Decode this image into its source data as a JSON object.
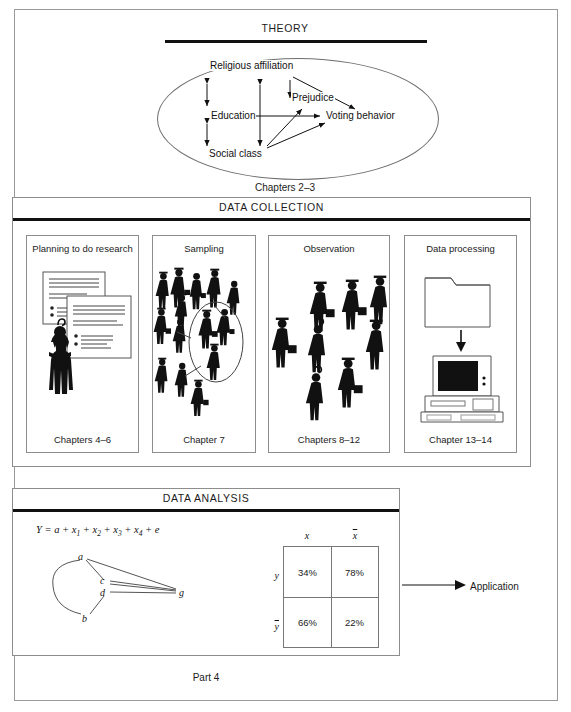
{
  "figure": {
    "outer_frame": true,
    "bottom_caption": "Part 4"
  },
  "theory": {
    "title": "THEORY",
    "caption": "Chapters 2–3",
    "nodes": [
      {
        "id": "religious-affiliation",
        "label": "Religious affiliation"
      },
      {
        "id": "education",
        "label": "Education"
      },
      {
        "id": "social-class",
        "label": "Social class"
      },
      {
        "id": "prejudice",
        "label": "Prejudice"
      },
      {
        "id": "voting-behavior",
        "label": "Voting behavior"
      }
    ],
    "relations": [
      {
        "from": "Religious affiliation",
        "to": "Education",
        "type": "double-arrow"
      },
      {
        "from": "Education",
        "to": "Social class",
        "type": "double-arrow"
      },
      {
        "from": "Religious affiliation",
        "to": "Social class",
        "type": "double-arrow"
      },
      {
        "from": "Religious affiliation",
        "to": "Prejudice",
        "type": "arrow"
      },
      {
        "from": "Religious affiliation",
        "to": "Voting behavior",
        "type": "arrow"
      },
      {
        "from": "Education",
        "to": "Voting behavior",
        "type": "arrow"
      },
      {
        "from": "Social class",
        "to": "Prejudice",
        "type": "arrow"
      },
      {
        "from": "Social class",
        "to": "Voting behavior",
        "type": "arrow"
      }
    ]
  },
  "data_collection": {
    "title": "DATA COLLECTION",
    "panels": [
      {
        "label": "Planning to do research",
        "caption": "Chapters 4–6",
        "art": "documents-and-researcher"
      },
      {
        "label": "Sampling",
        "caption": "Chapter 7",
        "art": "crowd-with-sample-ellipse"
      },
      {
        "label": "Observation",
        "caption": "Chapters 8–12",
        "art": "crowd-of-people"
      },
      {
        "label": "Data processing",
        "caption": "Chapter 13–14",
        "art": "folder-to-computer"
      }
    ]
  },
  "data_analysis": {
    "title": "DATA ANALYSIS",
    "formula": {
      "lhs": "Y",
      "eq": "=",
      "terms": [
        "a",
        "x1",
        "x2",
        "x3",
        "x4",
        "e"
      ],
      "display": "Y = a + x1 + x2 + x3 + x4 + e"
    },
    "sociogram": {
      "nodes": [
        "a",
        "b",
        "c",
        "d",
        "g"
      ],
      "edges": [
        [
          "a",
          "b"
        ],
        [
          "a",
          "c"
        ],
        [
          "a",
          "g"
        ],
        [
          "c",
          "g"
        ],
        [
          "d",
          "g"
        ],
        [
          "d",
          "b"
        ],
        [
          "c",
          "d"
        ]
      ]
    },
    "crosstab": {
      "col_headers": [
        "x",
        "x̄"
      ],
      "row_headers": [
        "y",
        "ȳ"
      ],
      "cells": [
        [
          "34%",
          "78%"
        ],
        [
          "66%",
          "22%"
        ]
      ]
    },
    "output_label": "Application"
  },
  "colors": {
    "ink": "#111111",
    "rule": "#8d8d8d",
    "paper": "#ffffff"
  }
}
